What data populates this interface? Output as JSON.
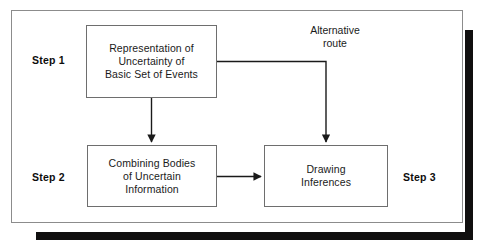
{
  "diagram": {
    "frame": {
      "border_color": "#8c8c8c",
      "shadow_color": "#100f0f",
      "background": "#ffffff"
    },
    "nodes": [
      {
        "id": "step1",
        "step_label": "Step 1",
        "text": "Representation of\nUncertainty of\nBasic Set of Events",
        "lines": [
          "Representation of",
          "Uncertainty of",
          "Basic Set of Events"
        ]
      },
      {
        "id": "step2",
        "step_label": "Step 2",
        "text": "Combining Bodies\nof Uncertain\nInformation",
        "lines": [
          "Combining Bodies",
          "of Uncertain",
          "Information"
        ]
      },
      {
        "id": "step3",
        "step_label": "Step 3",
        "text": "Drawing\nInferences",
        "lines": [
          "Drawing",
          "Inferences"
        ]
      }
    ],
    "annotations": [
      {
        "id": "alternative-route",
        "text": "Alternative\nroute"
      }
    ],
    "edges": [
      {
        "id": "step1-to-step2",
        "from": "step1",
        "to": "step2",
        "style": "straight-vertical",
        "arrow": true
      },
      {
        "id": "step2-to-step3",
        "from": "step2",
        "to": "step3",
        "style": "straight-horizontal",
        "arrow": true
      },
      {
        "id": "step1-to-step3",
        "from": "step1",
        "to": "step3",
        "style": "elbow",
        "arrow": true,
        "label": "Alternative route"
      }
    ]
  }
}
